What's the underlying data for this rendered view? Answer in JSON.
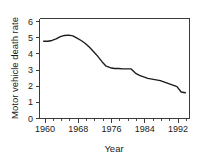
{
  "chart_data": {
    "type": "line",
    "title": "",
    "xlabel": "Year",
    "ylabel": "Motor vehicle death rate",
    "xlim": [
      1959,
      1995
    ],
    "ylim": [
      0,
      6.6
    ],
    "grid": false,
    "legend": "none",
    "x_ticks_major": [
      1960,
      1968,
      1976,
      1984,
      1992
    ],
    "x_tick_labels": [
      "1960",
      "1968",
      "1976",
      "1984",
      "1992"
    ],
    "x_ticks_minor": [
      1962,
      1964,
      1966,
      1970,
      1972,
      1974,
      1978,
      1980,
      1982,
      1986,
      1988,
      1990,
      1994
    ],
    "y_ticks": [
      0,
      1,
      2,
      3,
      4,
      5,
      6
    ],
    "y_tick_labels": [
      "0",
      "1",
      "2",
      "3",
      "4",
      "5",
      "6"
    ],
    "series_name": "Motor vehicle death rate",
    "line_color": "#1b1b1b",
    "axis_color": "#3b3b3b",
    "x": [
      1960,
      1961,
      1962,
      1963,
      1964,
      1965,
      1966,
      1967,
      1968,
      1969,
      1970,
      1971,
      1972,
      1973,
      1974,
      1975,
      1976,
      1977,
      1978,
      1979,
      1980,
      1981,
      1982,
      1983,
      1984,
      1985,
      1986,
      1987,
      1988,
      1989,
      1990,
      1991,
      1992,
      1993,
      1994
    ],
    "values": [
      5.1,
      5.1,
      5.15,
      5.25,
      5.4,
      5.48,
      5.5,
      5.45,
      5.3,
      5.15,
      4.95,
      4.7,
      4.4,
      4.1,
      3.75,
      3.45,
      3.35,
      3.3,
      3.3,
      3.28,
      3.28,
      3.27,
      3.0,
      2.85,
      2.75,
      2.65,
      2.6,
      2.55,
      2.5,
      2.4,
      2.3,
      2.2,
      2.1,
      1.75,
      1.7
    ]
  },
  "axes": {
    "xlabel": "Year",
    "ylabel": "Motor vehicle death rate"
  }
}
